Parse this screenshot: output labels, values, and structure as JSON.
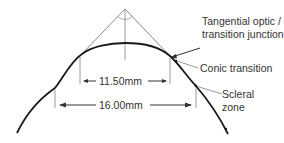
{
  "diagram": {
    "labels": {
      "tangential": [
        "Tangential optic /",
        "transition junction"
      ],
      "conic": "Conic transition",
      "scleral": [
        "Scleral",
        "zone"
      ]
    },
    "dimensions": {
      "inner": "11.50mm",
      "outer": "16.00mm"
    },
    "colors": {
      "curve": "#1a1a1a",
      "guide": "#9a9a9a",
      "text": "#333333"
    }
  }
}
